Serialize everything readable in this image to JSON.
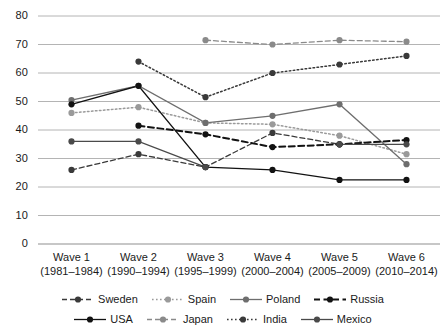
{
  "chart_data": {
    "type": "line",
    "title": "",
    "xlabel": "",
    "ylabel": "",
    "ylim": [
      0,
      80
    ],
    "yticks": [
      0,
      10,
      20,
      30,
      40,
      50,
      60,
      70,
      80
    ],
    "grid": true,
    "legend_position": "bottom",
    "categories": [
      "Wave 1\n(1981–1984)",
      "Wave 2\n(1990–1994)",
      "Wave 3\n(1995–1999)",
      "Wave 4\n(2000–2004)",
      "Wave 5\n(2005–2009)",
      "Wave 6\n(2010–2014)"
    ],
    "series": [
      {
        "name": "Sweden",
        "style": "dashed",
        "color": "#3a3a3a",
        "values": [
          26,
          31.5,
          27,
          39,
          35,
          null
        ]
      },
      {
        "name": "Spain",
        "style": "dotted",
        "color": "#9a9a9a",
        "values": [
          46,
          48,
          42.5,
          42,
          38,
          31.5
        ]
      },
      {
        "name": "Poland",
        "style": "solid",
        "color": "#6e6e6e",
        "values": [
          50.5,
          55.5,
          42.5,
          45,
          49,
          28
        ]
      },
      {
        "name": "Russia",
        "style": "dashed-thick",
        "color": "#121212",
        "values": [
          null,
          41.5,
          38.5,
          34,
          35,
          36.5
        ]
      },
      {
        "name": "USA",
        "style": "solid",
        "color": "#121212",
        "values": [
          49,
          55.5,
          27,
          26,
          22.5,
          22.5
        ]
      },
      {
        "name": "Japan",
        "style": "dashed",
        "color": "#8a8a8a",
        "values": [
          null,
          null,
          71.5,
          70,
          71.5,
          71
        ]
      },
      {
        "name": "India",
        "style": "dotted",
        "color": "#3a3a3a",
        "values": [
          null,
          64,
          51.5,
          60,
          63,
          66
        ]
      },
      {
        "name": "Mexico",
        "style": "solid",
        "color": "#4a4a4a",
        "values": [
          36,
          36,
          27,
          null,
          35,
          35
        ]
      }
    ]
  },
  "axis": {
    "y_tick_labels": [
      "80",
      "70",
      "60",
      "50",
      "40",
      "30",
      "20",
      "10",
      "0"
    ],
    "x_tick_labels": [
      {
        "wave": "Wave 1",
        "years": "(1981–1984)"
      },
      {
        "wave": "Wave 2",
        "years": "(1990–1994)"
      },
      {
        "wave": "Wave 3",
        "years": "(1995–1999)"
      },
      {
        "wave": "Wave 4",
        "years": "(2000–2004)"
      },
      {
        "wave": "Wave 5",
        "years": "(2005–2009)"
      },
      {
        "wave": "Wave 6",
        "years": "(2010–2014)"
      }
    ]
  },
  "legend": {
    "rows": [
      [
        {
          "label": "Sweden",
          "series": "Sweden"
        },
        {
          "label": "Spain",
          "series": "Spain"
        },
        {
          "label": "Poland",
          "series": "Poland"
        },
        {
          "label": "Russia",
          "series": "Russia"
        }
      ],
      [
        {
          "label": "USA",
          "series": "USA"
        },
        {
          "label": "Japan",
          "series": "Japan"
        },
        {
          "label": "India",
          "series": "India"
        },
        {
          "label": "Mexico",
          "series": "Mexico"
        }
      ]
    ]
  },
  "colors": {
    "gridline": "#b4b4b4",
    "axis": "#8c8c8c",
    "background": "#ffffff",
    "text": "#1a1a1a"
  }
}
